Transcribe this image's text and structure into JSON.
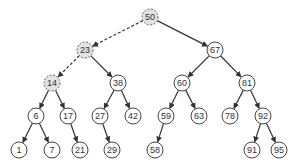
{
  "diagram": {
    "type": "binary-search-tree",
    "node_radius": 8,
    "colors": {
      "node_fill": "#ffffff",
      "node_stroke": "#444444",
      "highlight_fill": "#e2e2e2",
      "highlight_stroke": "#666666",
      "edge": "#333333"
    },
    "nodes": [
      {
        "id": "n50",
        "label": "50",
        "x": 150,
        "y": 17,
        "highlighted": true
      },
      {
        "id": "n23",
        "label": "23",
        "x": 85,
        "y": 50,
        "highlighted": true
      },
      {
        "id": "n67",
        "label": "67",
        "x": 215,
        "y": 50,
        "highlighted": false
      },
      {
        "id": "n14",
        "label": "14",
        "x": 52,
        "y": 83,
        "highlighted": true
      },
      {
        "id": "n38",
        "label": "38",
        "x": 118,
        "y": 83,
        "highlighted": false
      },
      {
        "id": "n60",
        "label": "60",
        "x": 182,
        "y": 83,
        "highlighted": false
      },
      {
        "id": "n81",
        "label": "81",
        "x": 247,
        "y": 83,
        "highlighted": false
      },
      {
        "id": "n6",
        "label": "6",
        "x": 36,
        "y": 116,
        "highlighted": false
      },
      {
        "id": "n17",
        "label": "17",
        "x": 68,
        "y": 116,
        "highlighted": false
      },
      {
        "id": "n27",
        "label": "27",
        "x": 100,
        "y": 116,
        "highlighted": false
      },
      {
        "id": "n42",
        "label": "42",
        "x": 133,
        "y": 116,
        "highlighted": false
      },
      {
        "id": "n59",
        "label": "59",
        "x": 166,
        "y": 116,
        "highlighted": false
      },
      {
        "id": "n63",
        "label": "63",
        "x": 199,
        "y": 116,
        "highlighted": false
      },
      {
        "id": "n78",
        "label": "78",
        "x": 230,
        "y": 116,
        "highlighted": false
      },
      {
        "id": "n92",
        "label": "92",
        "x": 263,
        "y": 116,
        "highlighted": false
      },
      {
        "id": "n1",
        "label": "1",
        "x": 19,
        "y": 150,
        "highlighted": false
      },
      {
        "id": "n7",
        "label": "7",
        "x": 52,
        "y": 150,
        "highlighted": false
      },
      {
        "id": "n21",
        "label": "21",
        "x": 80,
        "y": 150,
        "highlighted": false
      },
      {
        "id": "n29",
        "label": "29",
        "x": 112,
        "y": 150,
        "highlighted": false
      },
      {
        "id": "n58",
        "label": "58",
        "x": 155,
        "y": 150,
        "highlighted": false
      },
      {
        "id": "n91",
        "label": "91",
        "x": 252,
        "y": 150,
        "highlighted": false
      },
      {
        "id": "n95",
        "label": "95",
        "x": 279,
        "y": 150,
        "highlighted": false
      }
    ],
    "edges": [
      {
        "from": "n50",
        "to": "n23",
        "style": "dashed"
      },
      {
        "from": "n50",
        "to": "n67",
        "style": "solid"
      },
      {
        "from": "n23",
        "to": "n14",
        "style": "dashed"
      },
      {
        "from": "n23",
        "to": "n38",
        "style": "solid"
      },
      {
        "from": "n67",
        "to": "n60",
        "style": "solid"
      },
      {
        "from": "n67",
        "to": "n81",
        "style": "solid"
      },
      {
        "from": "n14",
        "to": "n6",
        "style": "solid"
      },
      {
        "from": "n14",
        "to": "n17",
        "style": "solid"
      },
      {
        "from": "n38",
        "to": "n27",
        "style": "solid"
      },
      {
        "from": "n38",
        "to": "n42",
        "style": "solid"
      },
      {
        "from": "n60",
        "to": "n59",
        "style": "solid"
      },
      {
        "from": "n60",
        "to": "n63",
        "style": "solid"
      },
      {
        "from": "n81",
        "to": "n78",
        "style": "solid"
      },
      {
        "from": "n81",
        "to": "n92",
        "style": "solid"
      },
      {
        "from": "n6",
        "to": "n1",
        "style": "solid"
      },
      {
        "from": "n6",
        "to": "n7",
        "style": "solid"
      },
      {
        "from": "n17",
        "to": "n21",
        "style": "solid"
      },
      {
        "from": "n27",
        "to": "n29",
        "style": "solid"
      },
      {
        "from": "n59",
        "to": "n58",
        "style": "solid"
      },
      {
        "from": "n92",
        "to": "n91",
        "style": "solid"
      },
      {
        "from": "n92",
        "to": "n95",
        "style": "solid"
      }
    ]
  }
}
